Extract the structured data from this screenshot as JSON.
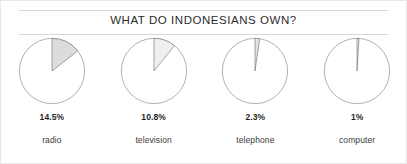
{
  "chart_data": {
    "type": "pie",
    "title": "WHAT DO INDONESIANS OWN?",
    "subtitle": "",
    "xlabel": "",
    "ylabel": "",
    "legend": "none",
    "grid": false,
    "note": "Four separate single-slice pie charts; each highlighted wedge is the percentage of Indonesians owning that item, drawn clockwise from 12 o'clock.",
    "categories": [
      "radio",
      "television",
      "telephone",
      "computer"
    ],
    "values": [
      14.5,
      10.8,
      2.3,
      1
    ],
    "value_labels": [
      "14.5%",
      "10.8%",
      "2.3%",
      "1%"
    ],
    "units": "percent",
    "series": [
      {
        "name": "owned",
        "values": [
          14.5,
          10.8,
          2.3,
          1
        ]
      }
    ],
    "slices": [
      {
        "category": "radio",
        "value": 14.5,
        "label": "14.5%",
        "degrees": 52.2,
        "fill": "#dcdcdc",
        "stroke": "#6e6e6e"
      },
      {
        "category": "television",
        "value": 10.8,
        "label": "10.8%",
        "degrees": 38.9,
        "fill": "#f0f0f0",
        "stroke": "#6e6e6e"
      },
      {
        "category": "telephone",
        "value": 2.3,
        "label": "2.3%",
        "degrees": 8.3,
        "fill": "#e4e4e4",
        "stroke": "#6e6e6e"
      },
      {
        "category": "computer",
        "value": 1,
        "label": "1%",
        "degrees": 3.6,
        "fill": "#e4e4e4",
        "stroke": "#6e6e6e"
      }
    ]
  },
  "colors": {
    "background": "#ffffff",
    "rule": "#d7d7d7",
    "circle_outline": "#808080",
    "title_text": "#2b2b2b",
    "value_text": "#1f1f1f",
    "category_text": "#3a3a3a"
  }
}
